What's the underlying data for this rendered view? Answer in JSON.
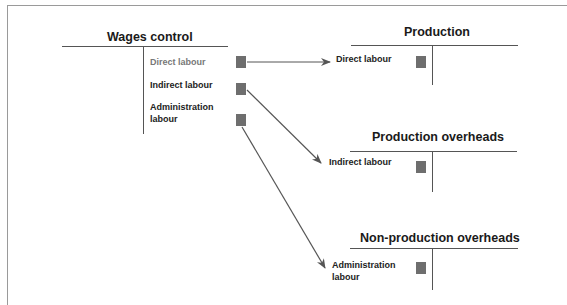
{
  "accounts": {
    "wages_control": {
      "title": "Wages control",
      "entries": [
        {
          "label": "Direct labour"
        },
        {
          "label": "Indirect labour"
        },
        {
          "label": "Administration labour",
          "lines": [
            "Administration",
            "labour"
          ]
        }
      ]
    },
    "production": {
      "title": "Production",
      "entries": [
        {
          "label": "Direct labour"
        }
      ]
    },
    "production_overheads": {
      "title": "Production overheads",
      "entries": [
        {
          "label": "Indirect labour"
        }
      ]
    },
    "non_production_overheads": {
      "title": "Non-production overheads",
      "entries": [
        {
          "label": "Administration labour",
          "lines": [
            "Administration",
            "labour"
          ]
        }
      ]
    }
  },
  "flows": [
    {
      "from": "wages_control.direct_labour",
      "to": "production.direct_labour"
    },
    {
      "from": "wages_control.indirect_labour",
      "to": "production_overheads.indirect_labour"
    },
    {
      "from": "wages_control.administration_labour",
      "to": "non_production_overheads.administration_labour"
    }
  ],
  "colors": {
    "marker": "#6e6e6e",
    "arrow": "#555555",
    "rule": "#555555"
  }
}
